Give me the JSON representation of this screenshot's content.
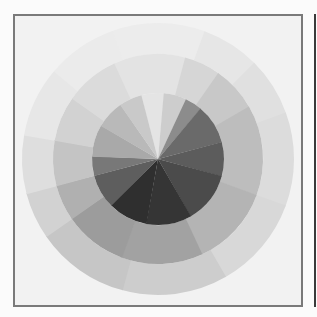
{
  "image": {
    "description": "Grayscale scan of a three-ring color wheel",
    "frame_color": "#7a7a7a",
    "frame_background": "#f2f2f2",
    "page_background": "#fbfbfb",
    "edge_line_color": "#3a3a3a"
  },
  "wheel": {
    "center": [
      143,
      143
    ],
    "rings": [
      {
        "name": "outer-ring",
        "r_inner": 105,
        "r_outer": 136,
        "segments": [
          {
            "start": -20,
            "end": 20,
            "fill": "#ececec"
          },
          {
            "start": 20,
            "end": 45,
            "fill": "#e6e6e6"
          },
          {
            "start": 45,
            "end": 70,
            "fill": "#e0e0e0"
          },
          {
            "start": 70,
            "end": 110,
            "fill": "#dcdcdc"
          },
          {
            "start": 110,
            "end": 150,
            "fill": "#d8d8d8"
          },
          {
            "start": 150,
            "end": 195,
            "fill": "#cdcdcd"
          },
          {
            "start": 195,
            "end": 235,
            "fill": "#c6c6c6"
          },
          {
            "start": 235,
            "end": 255,
            "fill": "#d2d2d2"
          },
          {
            "start": 255,
            "end": 280,
            "fill": "#dedede"
          },
          {
            "start": 280,
            "end": 310,
            "fill": "#e7e7e7"
          },
          {
            "start": 310,
            "end": 340,
            "fill": "#ebebeb"
          }
        ]
      },
      {
        "name": "middle-ring",
        "r_inner": 66,
        "r_outer": 105,
        "segments": [
          {
            "start": -25,
            "end": 15,
            "fill": "#e3e3e3"
          },
          {
            "start": 15,
            "end": 35,
            "fill": "#d6d6d6"
          },
          {
            "start": 35,
            "end": 60,
            "fill": "#c8c8c8"
          },
          {
            "start": 60,
            "end": 110,
            "fill": "#bdbdbd"
          },
          {
            "start": 110,
            "end": 155,
            "fill": "#b4b4b4"
          },
          {
            "start": 155,
            "end": 200,
            "fill": "#a2a2a2"
          },
          {
            "start": 200,
            "end": 235,
            "fill": "#9c9c9c"
          },
          {
            "start": 235,
            "end": 255,
            "fill": "#b0b0b0"
          },
          {
            "start": 255,
            "end": 280,
            "fill": "#c4c4c4"
          },
          {
            "start": 280,
            "end": 305,
            "fill": "#d2d2d2"
          },
          {
            "start": 305,
            "end": 335,
            "fill": "#dbdbdb"
          }
        ]
      },
      {
        "name": "inner-disk",
        "r_inner": 0,
        "r_outer": 66,
        "segments": [
          {
            "start": -15,
            "end": 5,
            "fill": "#e4e4e4"
          },
          {
            "start": 5,
            "end": 25,
            "fill": "#cdcdcd"
          },
          {
            "start": 25,
            "end": 40,
            "fill": "#8c8c8c"
          },
          {
            "start": 40,
            "end": 75,
            "fill": "#6a6a6a"
          },
          {
            "start": 75,
            "end": 105,
            "fill": "#5c5c5c"
          },
          {
            "start": 105,
            "end": 150,
            "fill": "#4b4b4b"
          },
          {
            "start": 150,
            "end": 190,
            "fill": "#353535"
          },
          {
            "start": 190,
            "end": 225,
            "fill": "#2f2f2f"
          },
          {
            "start": 225,
            "end": 255,
            "fill": "#5e5e5e"
          },
          {
            "start": 255,
            "end": 272,
            "fill": "#787878"
          },
          {
            "start": 272,
            "end": 300,
            "fill": "#a9a9a9"
          },
          {
            "start": 300,
            "end": 325,
            "fill": "#b9b9b9"
          },
          {
            "start": 325,
            "end": 345,
            "fill": "#c9c9c9"
          }
        ]
      }
    ]
  }
}
